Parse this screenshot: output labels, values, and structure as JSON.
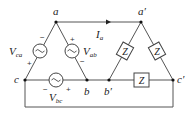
{
  "diagram": {
    "source_nodes": {
      "a": "a",
      "b": "b",
      "c": "c"
    },
    "load_nodes": {
      "a_prime": "a′",
      "b_prime": "b′",
      "c_prime": "c′"
    },
    "sources": [
      {
        "id": "Vca",
        "main": "V",
        "sub": "ca",
        "plus": "+",
        "minus": "−"
      },
      {
        "id": "Vab",
        "main": "V",
        "sub": "ab",
        "plus": "+",
        "minus": "−"
      },
      {
        "id": "Vbc",
        "main": "V",
        "sub": "bc",
        "plus": "+",
        "minus": "−"
      }
    ],
    "current": {
      "main": "I",
      "sub": "a"
    },
    "impedances": [
      {
        "label": "Z"
      },
      {
        "label": "Z"
      },
      {
        "label": "Z"
      }
    ],
    "colors": {
      "wire": "#555555",
      "node": "#111111",
      "text": "#222222"
    }
  }
}
